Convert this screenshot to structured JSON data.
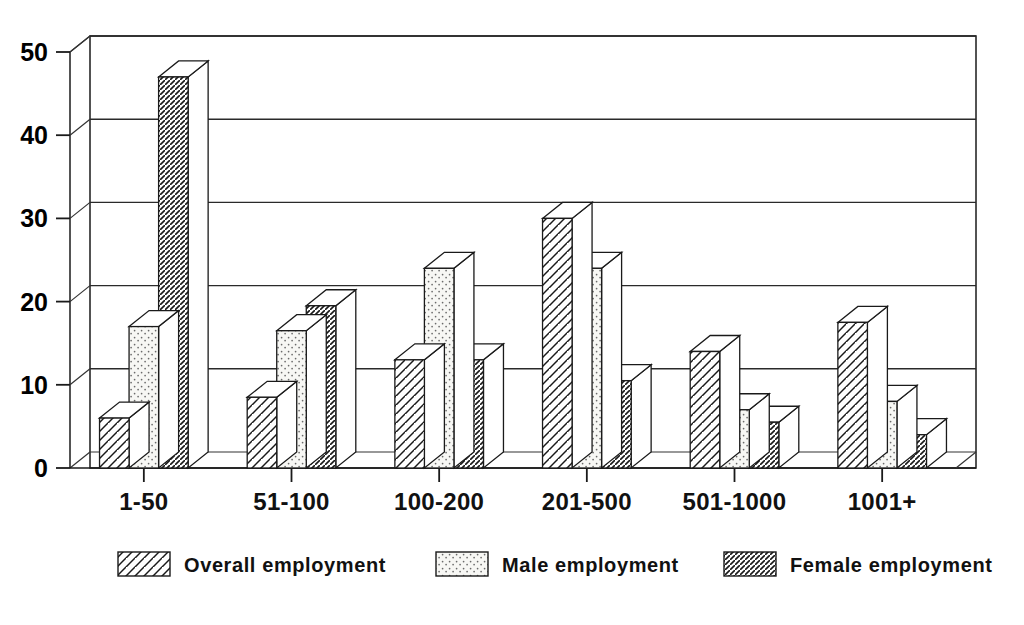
{
  "chart_data": {
    "type": "bar",
    "title": "",
    "subtitle": "",
    "xlabel": "",
    "ylabel": "",
    "categories": [
      "1-50",
      "51-100",
      "100-200",
      "201-500",
      "501-1000",
      "1001+"
    ],
    "series": [
      {
        "name": "Overall employment",
        "pattern": "diagonal-hatch-wide",
        "values": [
          6,
          8.5,
          13,
          30,
          14,
          17.5
        ]
      },
      {
        "name": "Male employment",
        "pattern": "dotted-stipple",
        "values": [
          17,
          16.5,
          24,
          24,
          7,
          8
        ]
      },
      {
        "name": "Female employment",
        "pattern": "diagonal-hatch-dense",
        "values": [
          47,
          19.5,
          13,
          10.5,
          5.5,
          4
        ]
      }
    ],
    "ylim": [
      0,
      50
    ],
    "yticks": [
      0,
      10,
      20,
      30,
      40,
      50
    ],
    "ytick_labels": [
      "0",
      "10",
      "20",
      "30",
      "40",
      "50"
    ],
    "grid": true,
    "grid_axis": "y",
    "legend_position": "bottom",
    "style": "3d-extruded-monochrome",
    "colors": {
      "axis": "#1a1a1a",
      "grid": "#2a2a2a",
      "bar_fill": "#ffffff",
      "hatch": "#1a1a1a",
      "background": "#ffffff"
    }
  },
  "legend": {
    "items": [
      {
        "label": "Overall employment",
        "swatch": "hatch-wide"
      },
      {
        "label": "Male employment",
        "swatch": "stipple"
      },
      {
        "label": "Female employment",
        "swatch": "hatch-dense"
      }
    ]
  },
  "axes": {
    "y": {
      "ticks": [
        "50",
        "40",
        "30",
        "20",
        "10",
        "0"
      ]
    },
    "x": {
      "ticks": [
        "1-50",
        "51-100",
        "100-200",
        "201-500",
        "501-1000",
        "1001+"
      ]
    }
  }
}
